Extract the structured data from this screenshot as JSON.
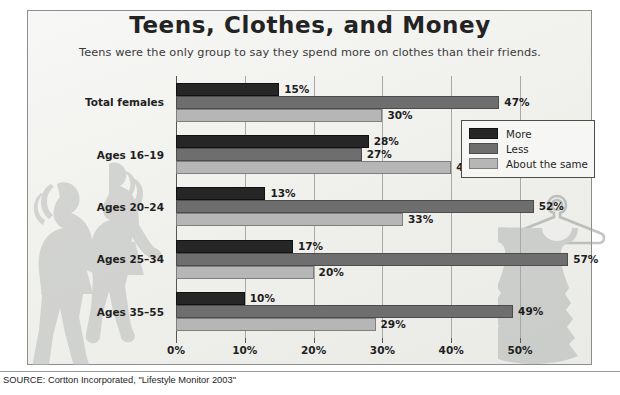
{
  "chart_data": {
    "type": "bar",
    "orientation": "horizontal",
    "title": "Teens, Clothes, and Money",
    "subtitle": "Teens were the only group to say they spend more on clothes than their friends.",
    "xlabel": "",
    "ylabel": "",
    "xlim": [
      0,
      50
    ],
    "xticks": [
      0,
      10,
      20,
      30,
      40,
      50
    ],
    "xtick_labels": [
      "0%",
      "10%",
      "20%",
      "30%",
      "40%",
      "50%"
    ],
    "grid": true,
    "legend_position": "inside-right-upper",
    "categories": [
      "Total females",
      "Ages 16–19",
      "Ages 20–24",
      "Ages 25–34",
      "Ages 35–55"
    ],
    "series": [
      {
        "name": "More",
        "color": "#262626",
        "values": [
          15,
          28,
          13,
          17,
          10
        ],
        "value_labels": [
          "15%",
          "28%",
          "13%",
          "17%",
          "10%"
        ]
      },
      {
        "name": "Less",
        "color": "#6e6e6e",
        "values": [
          47,
          27,
          52,
          57,
          49
        ],
        "value_labels": [
          "47%",
          "27%",
          "52%",
          "57%",
          "49%"
        ]
      },
      {
        "name": "About the same",
        "color": "#b6b6b6",
        "values": [
          30,
          40,
          33,
          20,
          29
        ],
        "value_labels": [
          "30%",
          "40%",
          "33%",
          "20%",
          "29%"
        ]
      }
    ],
    "source": "SOURCE: Cortton Incorporated, \"Lifestyle Monitor 2003\""
  },
  "legend": {
    "items": [
      {
        "label": "More",
        "color": "#262626"
      },
      {
        "label": "Less",
        "color": "#6e6e6e"
      },
      {
        "label": "About the same",
        "color": "#b6b6b6"
      }
    ]
  },
  "decoration": {
    "teens_silhouette": "two-teen-girls-walking-silhouette",
    "dress_silhouette": "dress-on-hanger-silhouette"
  },
  "footer": {
    "source": "SOURCE: Cortton Incorporated, \"Lifestyle Monitor 2003\""
  }
}
